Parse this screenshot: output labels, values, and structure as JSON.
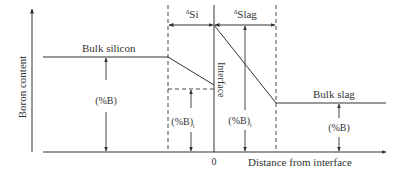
{
  "diagram": {
    "y_axis_label": "Boron content",
    "x_axis_label": "Distance from interface",
    "origin_label": "0",
    "interface_label": "Interface",
    "bulk_silicon_label": "Bulk silicon",
    "bulk_slag_label": "Bulk slag",
    "delta_si": {
      "symbol": "δ",
      "sub": "Si"
    },
    "delta_slag": {
      "symbol": "δ",
      "sub": "Slag"
    },
    "conc_bulk_si": "(%B)",
    "conc_interface_si": {
      "main": "(%B)",
      "sub": "i"
    },
    "conc_interface_slag": {
      "main": "(%B)",
      "sub": "i"
    },
    "conc_bulk_slag": "(%B)",
    "colors": {
      "line": "#333333",
      "background": "#ffffff"
    }
  }
}
